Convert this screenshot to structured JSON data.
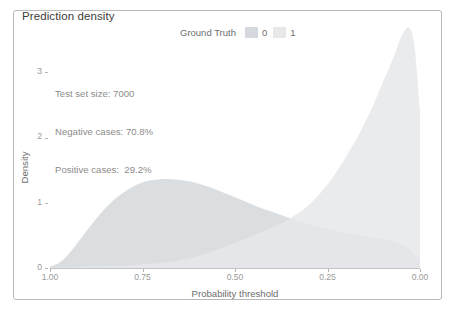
{
  "chart_data": {
    "type": "area",
    "title": "Prediction density",
    "xlabel": "Probability threshold",
    "ylabel": "Density",
    "grid": false,
    "legend_position": "top-right",
    "legend_title": "Ground Truth",
    "xlim": [
      1.0,
      0.0
    ],
    "ylim": [
      0,
      3.8
    ],
    "x_reversed": true,
    "xticks": [
      "1.00",
      "0.75",
      "0.50",
      "0.25",
      "0.00"
    ],
    "xtick_values": [
      1.0,
      0.75,
      0.5,
      0.25,
      0.0
    ],
    "yticks": [
      "0",
      "1",
      "2",
      "3"
    ],
    "ytick_values": [
      0,
      1,
      2,
      3
    ],
    "annotations": [
      "Test set size: 7000",
      "Negative cases: 70.8%",
      "Positive cases:  29.2%"
    ],
    "x": [
      1.0,
      0.97,
      0.94,
      0.91,
      0.88,
      0.85,
      0.82,
      0.79,
      0.76,
      0.73,
      0.7,
      0.67,
      0.64,
      0.61,
      0.58,
      0.55,
      0.52,
      0.49,
      0.46,
      0.43,
      0.4,
      0.37,
      0.34,
      0.31,
      0.28,
      0.25,
      0.22,
      0.19,
      0.16,
      0.13,
      0.1,
      0.07,
      0.05,
      0.03,
      0.015,
      0.0
    ],
    "series": [
      {
        "name": "0",
        "label": "0",
        "color": "#d5d8dc",
        "values": [
          0.02,
          0.1,
          0.28,
          0.5,
          0.72,
          0.92,
          1.08,
          1.2,
          1.29,
          1.34,
          1.36,
          1.36,
          1.34,
          1.31,
          1.26,
          1.2,
          1.13,
          1.06,
          0.99,
          0.92,
          0.86,
          0.8,
          0.74,
          0.69,
          0.64,
          0.6,
          0.56,
          0.53,
          0.5,
          0.47,
          0.44,
          0.4,
          0.36,
          0.3,
          0.22,
          0.12
        ]
      },
      {
        "name": "1",
        "label": "1",
        "color": "#e6e8ea",
        "values": [
          0.005,
          0.01,
          0.015,
          0.02,
          0.025,
          0.03,
          0.035,
          0.04,
          0.05,
          0.06,
          0.08,
          0.1,
          0.13,
          0.17,
          0.22,
          0.28,
          0.34,
          0.41,
          0.48,
          0.55,
          0.62,
          0.7,
          0.8,
          0.92,
          1.08,
          1.28,
          1.52,
          1.8,
          2.1,
          2.45,
          2.85,
          3.25,
          3.55,
          3.68,
          3.4,
          2.4
        ]
      }
    ]
  },
  "chart": {
    "title": "Prediction density",
    "legend": {
      "title": "Ground Truth",
      "entries": [
        {
          "label": "0",
          "color": "#d5d8dc"
        },
        {
          "label": "1",
          "color": "#e6e8ea"
        }
      ]
    },
    "annotation": {
      "line1": "Test set size: 7000",
      "line2": "Negative cases: 70.8%",
      "line3": "Positive cases:  29.2%"
    },
    "axes": {
      "y_label": "Density",
      "x_label": "Probability threshold",
      "y_ticks": [
        "3",
        "2",
        "1",
        "0"
      ],
      "x_ticks": [
        "1.00",
        "0.75",
        "0.50",
        "0.25",
        "0.00"
      ]
    }
  }
}
